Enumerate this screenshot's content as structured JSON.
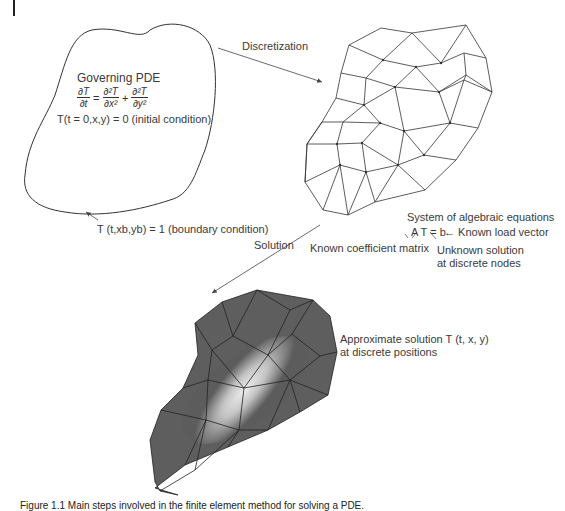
{
  "page_marker": "|",
  "domain_region": {
    "title": "Governing PDE",
    "pde": {
      "lhs_num": "∂T",
      "lhs_den": "∂t",
      "eq": "=",
      "term1_num": "∂²T",
      "term1_den": "∂x²",
      "plus": "+",
      "term2_num": "∂²T",
      "term2_den": "∂y²"
    },
    "initial_condition": "T(t = 0,x,y) = 0 (initial condition)",
    "boundary_condition": "T (t,xb,yb) = 1 (boundary condition)"
  },
  "arrows": {
    "discretization": "Discretization",
    "solution": "Solution"
  },
  "algebraic_system": {
    "title": "System of algebraic equations",
    "equation": "A T = b",
    "load_vector": "← Known load vector",
    "coefficient_matrix": "Known coefficient matrix",
    "unknown_solution_line1": "Unknown solution",
    "unknown_solution_line2": "at discrete nodes"
  },
  "result": {
    "line1": "Approximate solution T (t, x, y)",
    "line2": "at discrete positions"
  },
  "caption": "Figure 1.1  Main steps involved in the finite element method for solving a PDE.",
  "colors": {
    "mesh_line": "#333333",
    "solution_dark": "#5a5a5a",
    "solution_light": "#f2f2f2",
    "text": "#3a3a3a"
  }
}
